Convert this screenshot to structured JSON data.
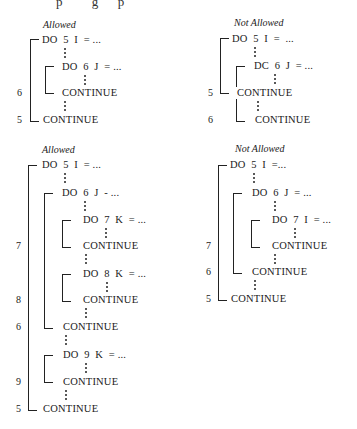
{
  "header_fragment": "p         g      p",
  "panels": [
    {
      "label": "Allowed",
      "lines": [
        "DO  5  I  = ...",
        "DO  6  J  = ...",
        "CONTINUE",
        "CONTINUE"
      ],
      "labels": [
        "6",
        "5"
      ]
    },
    {
      "label": "Not Allowed",
      "lines": [
        "DO  5  I  =  ...",
        "DC  6  J  = ...",
        "CONTINUE",
        "CONTINUE"
      ],
      "labels": [
        "5",
        "6"
      ]
    },
    {
      "label": "Allowed",
      "lines": [
        "DO  5  I  = ...",
        "DO  6  J  - ...",
        "DO  7  K  = ...",
        "CONTINUE",
        "DO  8  K  = ...",
        "CONTINUE",
        "CONTINUE",
        "DO  9  K  = ...",
        "CONTINUE",
        "CONTINUE"
      ],
      "labels": [
        "7",
        "8",
        "6",
        "9",
        "5"
      ]
    },
    {
      "label": "Not Allowed",
      "lines": [
        "DO  5  I  =...",
        "DO  6  J  = ...",
        "DO  7  I  = ...",
        "CONTINUE",
        "CONTINUE",
        "CONTINUE"
      ],
      "labels": [
        "7",
        "6",
        "5"
      ]
    }
  ]
}
